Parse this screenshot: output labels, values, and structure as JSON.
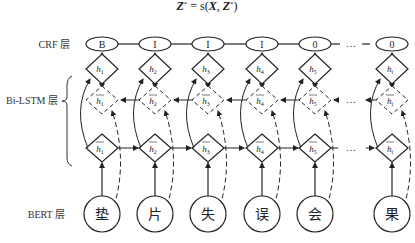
{
  "formula": {
    "lhs": "Z",
    "sup": "*",
    "rhs_prefix": " = s(",
    "X": "X",
    "comma": ", ",
    "Z": "Z",
    "close": ")"
  },
  "layers": {
    "crf": "CRF 层",
    "bilstm": "Bi-LSTM 层",
    "bert": "BERT 层"
  },
  "columns": [
    {
      "tag": "B",
      "h_sub": "1",
      "char": "垫"
    },
    {
      "tag": "I",
      "h_sub": "2",
      "char": "片"
    },
    {
      "tag": "I",
      "h_sub": "3",
      "char": "失"
    },
    {
      "tag": "I",
      "h_sub": "4",
      "char": "误"
    },
    {
      "tag": "0",
      "h_sub": "5",
      "char": "会"
    },
    {
      "tag": "0",
      "h_sub": "i",
      "char": "果"
    }
  ],
  "ellipsis": "…",
  "h_symbol": "h"
}
